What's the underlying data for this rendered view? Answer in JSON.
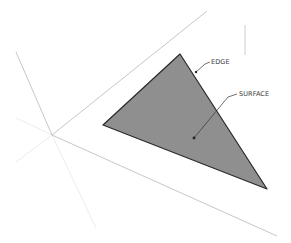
{
  "diagram": {
    "type": "3d-geometry-illustration",
    "labels": {
      "edge": "EDGE",
      "surface": "SURFACE"
    },
    "colors": {
      "background": "#ffffff",
      "surface_fill": "#8f8f8f",
      "edge_stroke": "#2a2a2a",
      "axis_line": "#b5b5b5",
      "axis_hidden": "#ececec",
      "leader": "#333333",
      "label_text": "#3a3a3a"
    },
    "shapes": {
      "triangle": [
        [
          180,
          54
        ],
        [
          103,
          125
        ],
        [
          267,
          189
        ]
      ],
      "axis_origin": [
        52,
        135
      ]
    }
  }
}
